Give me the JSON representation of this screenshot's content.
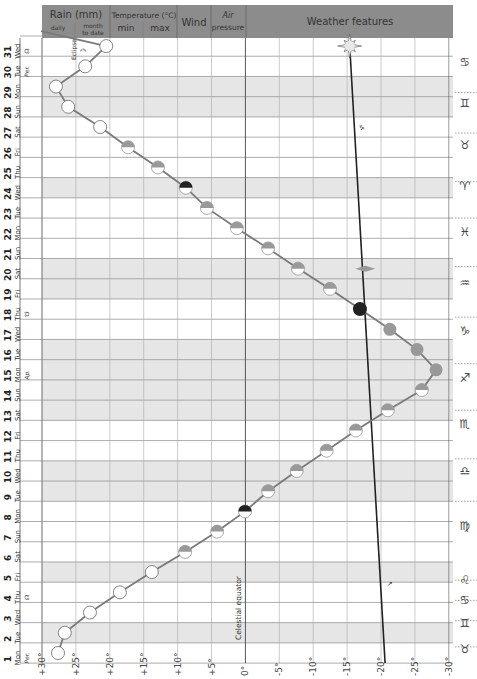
{
  "header": {
    "rain": "Rain (mm)",
    "rain_day": "daily",
    "rain_month": "month",
    "rain_month2": "to date",
    "temperature": "Temperature (°C)",
    "temp_min": "min",
    "temp_max": "max",
    "wind": "Wind",
    "air": "Air",
    "pressure": "pressure",
    "features": "Weather features"
  },
  "annotations": {
    "eclipse": "Eclipse",
    "celestial_equator": "Celestial equator"
  },
  "colors": {
    "header_bg": "#8c8c8c",
    "weekend_band": "#e6e6e6",
    "grid": "#9a9a9a",
    "moon_line": "#7a7a7a",
    "sun_line": "#222222",
    "moon_dark": "#222222",
    "moon_gray": "#999999"
  },
  "days": [
    {
      "n": "1",
      "d": "Mon",
      "note": "Per.",
      "band": false
    },
    {
      "n": "2",
      "d": "Tue",
      "note": "",
      "band": true
    },
    {
      "n": "3",
      "d": "Wed",
      "note": "",
      "band": false
    },
    {
      "n": "4",
      "d": "Thu",
      "note": "☊",
      "band": false
    },
    {
      "n": "5",
      "d": "Fri",
      "note": "",
      "band": true
    },
    {
      "n": "6",
      "d": "Sat",
      "note": "",
      "band": false
    },
    {
      "n": "7",
      "d": "Sun",
      "note": "",
      "band": false
    },
    {
      "n": "8",
      "d": "Mon",
      "note": "",
      "band": false
    },
    {
      "n": "9",
      "d": "Tue",
      "note": "",
      "band": true
    },
    {
      "n": "10",
      "d": "Wed",
      "note": "",
      "band": true
    },
    {
      "n": "11",
      "d": "Thu",
      "note": "",
      "band": false
    },
    {
      "n": "12",
      "d": "Fri",
      "note": "",
      "band": false
    },
    {
      "n": "13",
      "d": "Sat",
      "note": "",
      "band": true
    },
    {
      "n": "14",
      "d": "Sun",
      "note": "",
      "band": true
    },
    {
      "n": "15",
      "d": "Mon",
      "note": "Ap.",
      "band": true
    },
    {
      "n": "16",
      "d": "Tue",
      "note": "",
      "band": true
    },
    {
      "n": "17",
      "d": "Wed",
      "note": "",
      "band": false
    },
    {
      "n": "18",
      "d": "Thu",
      "note": "☋",
      "band": false
    },
    {
      "n": "19",
      "d": "Fri",
      "note": "",
      "band": true
    },
    {
      "n": "20",
      "d": "Sat",
      "note": "",
      "band": true
    },
    {
      "n": "21",
      "d": "Sun",
      "note": "",
      "band": false
    },
    {
      "n": "22",
      "d": "Mon",
      "note": "",
      "band": false
    },
    {
      "n": "23",
      "d": "Tue",
      "note": "",
      "band": false
    },
    {
      "n": "24",
      "d": "Wed",
      "note": "",
      "band": true
    },
    {
      "n": "25",
      "d": "Thu",
      "note": "",
      "band": false
    },
    {
      "n": "26",
      "d": "Fri",
      "note": "",
      "band": false
    },
    {
      "n": "27",
      "d": "Sat",
      "note": "",
      "band": false
    },
    {
      "n": "28",
      "d": "Sun",
      "note": "",
      "band": true
    },
    {
      "n": "29",
      "d": "Mon",
      "note": "",
      "band": true
    },
    {
      "n": "30",
      "d": "Tue",
      "note": "Per.",
      "band": false
    },
    {
      "n": "31",
      "d": "Wed",
      "note": "☊",
      "band": false
    }
  ],
  "zodiac": [
    {
      "sym": "♉",
      "day": 1.2
    },
    {
      "sym": "♊",
      "day": 2.5
    },
    {
      "sym": "♋",
      "day": 3.6
    },
    {
      "sym": "♌",
      "day": 4.6
    },
    {
      "sym": "♍",
      "day": 7.3
    },
    {
      "sym": "♎",
      "day": 10
    },
    {
      "sym": "♏",
      "day": 12.3
    },
    {
      "sym": "♐",
      "day": 14.6
    },
    {
      "sym": "♑",
      "day": 16.9
    },
    {
      "sym": "♒",
      "day": 19.3
    },
    {
      "sym": "♓",
      "day": 21.8
    },
    {
      "sym": "♈",
      "day": 24.1
    },
    {
      "sym": "♉",
      "day": 26.1
    },
    {
      "sym": "♊",
      "day": 28.2
    },
    {
      "sym": "♋",
      "day": 30.2
    }
  ],
  "chart_data": {
    "type": "line",
    "xlabel": "Declination (degrees)",
    "ylabel": "Day of month",
    "x_ticks": [
      "+30°",
      "+25°",
      "+20°",
      "+15°",
      "+10°",
      "+5°",
      "0°",
      "-5°",
      "-10°",
      "-15°",
      "-20°",
      "-25°",
      "-30°"
    ],
    "xlim": [
      30,
      -30
    ],
    "categories": [
      "1",
      "2",
      "3",
      "4",
      "5",
      "6",
      "7",
      "8",
      "9",
      "10",
      "11",
      "12",
      "13",
      "14",
      "15",
      "16",
      "17",
      "18",
      "19",
      "20",
      "21",
      "22",
      "23",
      "24",
      "25",
      "26",
      "27",
      "28",
      "29",
      "30",
      "31"
    ],
    "series": [
      {
        "name": "Moon declination",
        "values": [
          27.5,
          26.5,
          22.8,
          18.4,
          13.7,
          8.8,
          4.1,
          0,
          -3.4,
          -7.6,
          -12,
          -16.3,
          -21,
          -26,
          -28.1,
          -25.3,
          -21.3,
          -16.9,
          -12.5,
          -7.8,
          -3.4,
          1.2,
          5.6,
          8.7,
          12.8,
          17.2,
          21.3,
          26,
          27.8,
          23.5,
          20.4
        ],
        "phases": [
          "full",
          "full",
          "full",
          "full",
          "full",
          "waning",
          "waning",
          "last-quarter",
          "waning",
          "waning",
          "waning",
          "waning",
          "waning",
          "waning",
          "new",
          "new",
          "new",
          "new-dark",
          "waxing",
          "waxing",
          "waxing",
          "waxing",
          "waxing",
          "first-quarter",
          "waxing",
          "waxing",
          "full",
          "full",
          "full",
          "full",
          "full"
        ]
      },
      {
        "name": "Sun declination",
        "values": [
          -20.6,
          -20.5,
          -20.4,
          -20.2,
          -20.1,
          -20,
          -19.8,
          -19.7,
          -19.5,
          -19.4,
          -19.2,
          -19,
          -18.9,
          -18.7,
          -18.5,
          -18.3,
          -18.1,
          -17.9,
          -17.8,
          -17.6,
          -17.4,
          -17.2,
          -17,
          -16.8,
          -16.6,
          -16.4,
          -16.2,
          -16,
          -15.8,
          -15.6,
          -15.4
        ]
      }
    ],
    "annotations": [
      "Eclipse (day 30-31)",
      "Celestial equator (0°)",
      "Per. (perigee) day 1 and 30",
      "Ap. (apogee) day 15",
      "Ascending node day 4 and 31",
      "Descending node day 18"
    ],
    "grid": true
  }
}
